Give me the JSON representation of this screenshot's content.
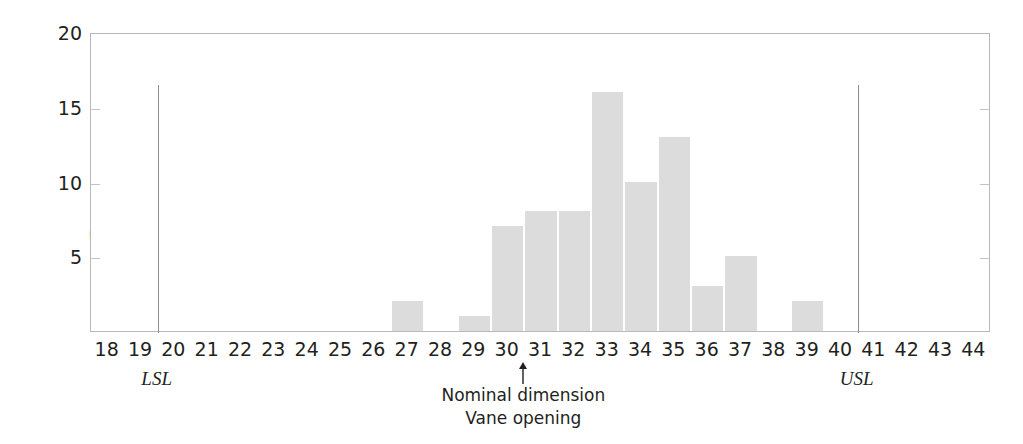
{
  "chart_data": {
    "type": "bar",
    "title": "",
    "subtitle": "",
    "xlabel": "Vane opening",
    "ylabel": "Frequency",
    "xlim": [
      17.5,
      44.5
    ],
    "ylim": [
      0,
      20
    ],
    "grid": false,
    "legend": "none",
    "bar_color": "#dcdcdc",
    "axis_color": "#b9b9b9",
    "text_color": "#231f20",
    "categories": [
      18,
      19,
      20,
      21,
      22,
      23,
      24,
      25,
      26,
      27,
      28,
      29,
      30,
      31,
      32,
      33,
      34,
      35,
      36,
      37,
      38,
      39,
      40,
      41,
      42,
      43,
      44
    ],
    "values": [
      0,
      0,
      0,
      0,
      0,
      0,
      0,
      0,
      0,
      2,
      0,
      1,
      7,
      8,
      8,
      16,
      10,
      13,
      3,
      5,
      0,
      2,
      0,
      0,
      0,
      0,
      0
    ],
    "x_tick_labels": [
      "18",
      "19",
      "20",
      "21",
      "22",
      "23",
      "24",
      "25",
      "26",
      "27",
      "28",
      "29",
      "30",
      "31",
      "32",
      "33",
      "34",
      "35",
      "36",
      "37",
      "38",
      "39",
      "40",
      "41",
      "42",
      "43",
      "44"
    ],
    "y_ticks": [
      5,
      10,
      15,
      20
    ],
    "y_tick_labels": [
      "5",
      "10",
      "15",
      "20"
    ],
    "annotations": [
      {
        "name": "lower-spec-limit",
        "label": "LSL",
        "x": 19.5,
        "y_top": 16.6,
        "kind": "vertical-line"
      },
      {
        "name": "upper-spec-limit",
        "label": "USL",
        "x": 40.5,
        "y_top": 16.6,
        "kind": "vertical-line"
      },
      {
        "name": "nominal-dimension",
        "label_line_1": "Nominal dimension",
        "label_line_2": "Vane opening",
        "x": 30.5,
        "kind": "arrow-up"
      }
    ]
  },
  "axes": {
    "y_title": "Frequency"
  },
  "labels": {
    "lsl": "LSL",
    "usl": "USL",
    "nominal_line_1": "Nominal dimension",
    "nominal_line_2": "Vane opening"
  }
}
